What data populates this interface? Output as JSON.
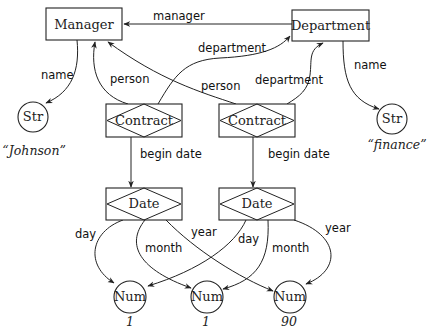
{
  "diagram": {
    "type": "semantic-network",
    "nodes": {
      "manager": {
        "label": "Manager",
        "shape": "rectangle"
      },
      "department": {
        "label": "Department",
        "shape": "rectangle"
      },
      "str_left": {
        "label": "Str",
        "shape": "circle",
        "value": "“Johnson”"
      },
      "str_right": {
        "label": "Str",
        "shape": "circle",
        "value": "“finance”"
      },
      "contract_left": {
        "label": "Contract",
        "shape": "relationship-box"
      },
      "contract_right": {
        "label": "Contract",
        "shape": "relationship-box"
      },
      "date_left": {
        "label": "Date",
        "shape": "relationship-box"
      },
      "date_right": {
        "label": "Date",
        "shape": "relationship-box"
      },
      "num_1": {
        "label": "Num",
        "shape": "circle",
        "value": "1"
      },
      "num_2": {
        "label": "Num",
        "shape": "circle",
        "value": "1"
      },
      "num_3": {
        "label": "Num",
        "shape": "circle",
        "value": "90"
      }
    },
    "edges": {
      "department_manager": {
        "from": "department",
        "to": "manager",
        "label": "manager"
      },
      "manager_name": {
        "from": "manager",
        "to": "str_left",
        "label": "name"
      },
      "department_name": {
        "from": "department",
        "to": "str_right",
        "label": "name"
      },
      "contract_left_person": {
        "from": "contract_left",
        "to": "manager",
        "label": "person"
      },
      "contract_left_department": {
        "from": "contract_left",
        "to": "department",
        "label": "department"
      },
      "contract_right_person": {
        "from": "contract_right",
        "to": "manager",
        "label": "person"
      },
      "contract_right_department": {
        "from": "contract_right",
        "to": "department",
        "label": "department"
      },
      "contract_left_begin": {
        "from": "contract_left",
        "to": "date_left",
        "label": "begin date"
      },
      "contract_right_begin": {
        "from": "contract_right",
        "to": "date_right",
        "label": "begin date"
      },
      "date_left_day": {
        "from": "date_left",
        "to": "num_1",
        "label": "day"
      },
      "date_left_month": {
        "from": "date_left",
        "to": "num_2",
        "label": "month"
      },
      "date_left_year": {
        "from": "date_left",
        "to": "num_3",
        "label": "year"
      },
      "date_right_day": {
        "from": "date_right",
        "to": "num_1",
        "label": "day"
      },
      "date_right_month": {
        "from": "date_right",
        "to": "num_2",
        "label": "month"
      },
      "date_right_year": {
        "from": "date_right",
        "to": "num_3",
        "label": "year"
      }
    }
  }
}
